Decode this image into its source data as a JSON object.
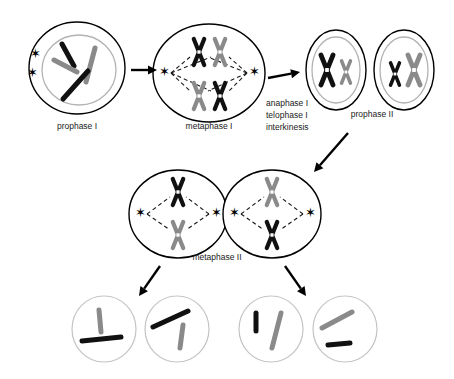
{
  "diagram": {
    "colors": {
      "chromosome_maternal": "#111111",
      "chromosome_paternal": "#8a8a8a",
      "cell_membrane": "#000000",
      "nuclear_membrane": "#b3b3b3",
      "gamete_membrane": "#c4c4c4",
      "background": "#ffffff"
    },
    "stages": [
      {
        "id": "prophase-i",
        "label": "prophase I",
        "label_x": 77,
        "label_y": 127,
        "cell": {
          "cx": 77,
          "cy": 68,
          "rx": 48,
          "ry": 46
        },
        "nucleus": {
          "cx": 79,
          "cy": 70,
          "rx": 37,
          "ry": 35
        },
        "asters": [
          {
            "x": 35,
            "y": 55
          },
          {
            "x": 32,
            "y": 74
          }
        ],
        "chromosomes": [
          {
            "shade": "dark",
            "x1": 62,
            "y1": 44,
            "x2": 74,
            "y2": 66,
            "width": 5
          },
          {
            "shade": "gray",
            "x1": 54,
            "y1": 60,
            "x2": 77,
            "y2": 72,
            "width": 5
          },
          {
            "shade": "gray",
            "x1": 95,
            "y1": 48,
            "x2": 86,
            "y2": 82,
            "width": 5
          },
          {
            "shade": "dark",
            "x1": 88,
            "y1": 71,
            "x2": 63,
            "y2": 99,
            "width": 5
          }
        ]
      },
      {
        "id": "metaphase-i",
        "label": "metaphase I",
        "label_x": 209,
        "label_y": 127,
        "cell": {
          "cx": 209,
          "cy": 73,
          "rx": 56,
          "ry": 49
        },
        "asters": [
          {
            "x": 164,
            "y": 73
          },
          {
            "x": 254,
            "y": 73
          }
        ],
        "tetrads": [
          {
            "cx": 199,
            "cy": 52,
            "shade": "dark",
            "scale": 1.0
          },
          {
            "cx": 220,
            "cy": 52,
            "shade": "gray",
            "scale": 1.0
          },
          {
            "cx": 199,
            "cy": 96,
            "shade": "gray",
            "scale": 1.0
          },
          {
            "cx": 220,
            "cy": 96,
            "shade": "dark",
            "scale": 1.0
          }
        ]
      },
      {
        "id": "prophase-ii",
        "label": "prophase II",
        "label_x": 372,
        "label_y": 115,
        "cells": [
          {
            "cell": {
              "cx": 336,
              "cy": 70,
              "rx": 30,
              "ry": 40
            },
            "nucleus": {
              "cx": 336,
              "cy": 70,
              "rx": 24,
              "ry": 33
            },
            "chromosomes": [
              {
                "cx": 327,
                "cy": 70,
                "shade": "dark",
                "scale": 1.15
              },
              {
                "cx": 346,
                "cy": 72,
                "shade": "gray",
                "scale": 0.85
              }
            ]
          },
          {
            "cell": {
              "cx": 404,
              "cy": 70,
              "rx": 30,
              "ry": 40
            },
            "nucleus": {
              "cx": 404,
              "cy": 70,
              "rx": 24,
              "ry": 33
            },
            "chromosomes": [
              {
                "cx": 395,
                "cy": 74,
                "shade": "dark",
                "scale": 0.85
              },
              {
                "cx": 414,
                "cy": 70,
                "shade": "gray",
                "scale": 1.15
              }
            ]
          }
        ]
      },
      {
        "id": "metaphase-ii",
        "label": "metaphase II",
        "label_x": 217,
        "label_y": 258,
        "cells": [
          {
            "cell": {
              "cx": 178,
              "cy": 214,
              "rx": 49,
              "ry": 44
            },
            "asters": [
              {
                "x": 140,
                "y": 214
              },
              {
                "x": 216,
                "y": 214
              }
            ],
            "chromosomes": [
              {
                "cx": 178,
                "cy": 192,
                "shade": "dark",
                "scale": 1.0
              },
              {
                "cx": 178,
                "cy": 235,
                "shade": "gray",
                "scale": 1.0
              }
            ]
          },
          {
            "cell": {
              "cx": 272,
              "cy": 214,
              "rx": 49,
              "ry": 44
            },
            "asters": [
              {
                "x": 234,
                "y": 214
              },
              {
                "x": 310,
                "y": 214
              }
            ],
            "chromosomes": [
              {
                "cx": 272,
                "cy": 192,
                "shade": "gray",
                "scale": 1.0
              },
              {
                "cx": 272,
                "cy": 235,
                "shade": "dark",
                "scale": 1.0
              }
            ]
          }
        ]
      },
      {
        "id": "gametes",
        "label": "",
        "cells": [
          {
            "cell": {
              "cx": 104,
              "cy": 329,
              "rx": 32,
              "ry": 33
            },
            "chromosomes": [
              {
                "shade": "gray",
                "x1": 99,
                "y1": 310,
                "x2": 101,
                "y2": 332,
                "width": 5
              },
              {
                "shade": "dark",
                "x1": 82,
                "y1": 341,
                "x2": 121,
                "y2": 337,
                "width": 5
              }
            ]
          },
          {
            "cell": {
              "cx": 177,
              "cy": 329,
              "rx": 32,
              "ry": 33
            },
            "chromosomes": [
              {
                "shade": "dark",
                "x1": 153,
                "y1": 327,
                "x2": 188,
                "y2": 311,
                "width": 5
              },
              {
                "shade": "gray",
                "x1": 183,
                "y1": 325,
                "x2": 180,
                "y2": 348,
                "width": 5
              }
            ]
          },
          {
            "cell": {
              "cx": 271,
              "cy": 329,
              "rx": 32,
              "ry": 33
            },
            "chromosomes": [
              {
                "shade": "dark",
                "x1": 256,
                "y1": 313,
                "x2": 256,
                "y2": 331,
                "width": 5
              },
              {
                "shade": "gray",
                "x1": 281,
                "y1": 313,
                "x2": 272,
                "y2": 348,
                "width": 5
              }
            ]
          },
          {
            "cell": {
              "cx": 345,
              "cy": 329,
              "rx": 32,
              "ry": 33
            },
            "chromosomes": [
              {
                "shade": "gray",
                "x1": 322,
                "y1": 328,
                "x2": 352,
                "y2": 312,
                "width": 5
              },
              {
                "shade": "dark",
                "x1": 328,
                "y1": 345,
                "x2": 350,
                "y2": 343,
                "width": 5
              }
            ]
          }
        ]
      }
    ],
    "transition_labels": [
      {
        "id": "anaphase-i",
        "text": "anaphase I",
        "x": 266,
        "y": 104
      },
      {
        "id": "telophase-i",
        "text": "telophase I",
        "x": 266,
        "y": 116
      },
      {
        "id": "interkinesis",
        "text": "interkinesis",
        "x": 266,
        "y": 128
      }
    ],
    "arrows": [
      {
        "id": "arrow-prophase-i-to-metaphase-i",
        "x1": 131,
        "y1": 70,
        "x2": 157,
        "y2": 70
      },
      {
        "id": "arrow-metaphase-i-to-prophase-ii",
        "x1": 268,
        "y1": 78,
        "x2": 300,
        "y2": 72
      },
      {
        "id": "arrow-prophase-ii-to-metaphase-ii",
        "x1": 348,
        "y1": 133,
        "x2": 314,
        "y2": 172
      },
      {
        "id": "arrow-metaphase-ii-left-to-gametes",
        "x1": 160,
        "y1": 266,
        "x2": 139,
        "y2": 296
      },
      {
        "id": "arrow-metaphase-ii-right-to-gametes",
        "x1": 285,
        "y1": 266,
        "x2": 306,
        "y2": 296
      }
    ]
  }
}
